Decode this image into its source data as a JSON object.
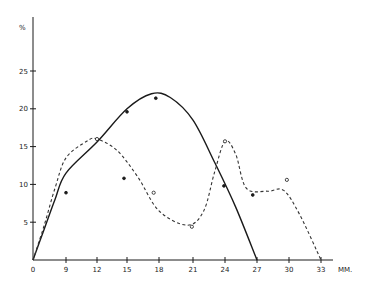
{
  "chart_data": {
    "type": "line",
    "title": "",
    "xlabel": "MM.",
    "ylabel": "%",
    "x_ticks": [
      0,
      9,
      12,
      15,
      18,
      21,
      24,
      27,
      30,
      33
    ],
    "y_ticks": [
      5,
      10,
      15,
      20,
      25
    ],
    "origin_label": "0",
    "xlim": [
      0,
      33
    ],
    "ylim": [
      0,
      25
    ],
    "grid": false,
    "legend": null,
    "series": [
      {
        "name": "solid-curve",
        "style": "solid",
        "color": "#1a1a1a",
        "x": [
          0,
          3,
          6,
          9,
          12,
          15,
          17.3,
          19,
          21,
          23,
          25,
          27
        ],
        "y": [
          0,
          4,
          8,
          11.5,
          15.6,
          20,
          22,
          21.5,
          18.5,
          13,
          7,
          0
        ]
      },
      {
        "name": "dashed-curve",
        "style": "dashed",
        "color": "#333333",
        "x": [
          0,
          3,
          6,
          9,
          11,
          12,
          14,
          16,
          18,
          20.5,
          22,
          23,
          24,
          25,
          26,
          28,
          29.5,
          31,
          33
        ],
        "y": [
          0,
          4.5,
          9.5,
          13.5,
          15.7,
          16,
          14.5,
          11,
          6.5,
          4.6,
          6.5,
          11.5,
          15.7,
          14,
          9.5,
          9.1,
          9.2,
          6,
          0
        ]
      }
    ],
    "points": [
      {
        "x": 9,
        "y": 8.9,
        "marker": "filled"
      },
      {
        "x": 12,
        "y": 16.0,
        "marker": "open"
      },
      {
        "x": 15,
        "y": 19.6,
        "marker": "filled"
      },
      {
        "x": 17.7,
        "y": 21.4,
        "marker": "filled"
      },
      {
        "x": 14.7,
        "y": 10.8,
        "marker": "filled"
      },
      {
        "x": 17.5,
        "y": 8.9,
        "marker": "open"
      },
      {
        "x": 20.9,
        "y": 4.4,
        "marker": "open"
      },
      {
        "x": 24,
        "y": 15.7,
        "marker": "open"
      },
      {
        "x": 23.9,
        "y": 9.8,
        "marker": "filled"
      },
      {
        "x": 26.6,
        "y": 8.6,
        "marker": "filled"
      },
      {
        "x": 29.8,
        "y": 10.6,
        "marker": "open"
      }
    ]
  },
  "layout": {
    "x_px_map": [
      [
        0,
        33
      ],
      [
        9,
        66
      ],
      [
        12,
        97
      ],
      [
        15,
        127
      ],
      [
        18,
        159
      ],
      [
        21,
        193
      ],
      [
        24,
        225
      ],
      [
        27,
        257
      ],
      [
        30,
        289
      ],
      [
        33,
        321
      ]
    ],
    "y0_px": 260,
    "y_px_per_unit": 7.56,
    "axis_x_end": 333,
    "axis_y_top": 17
  }
}
